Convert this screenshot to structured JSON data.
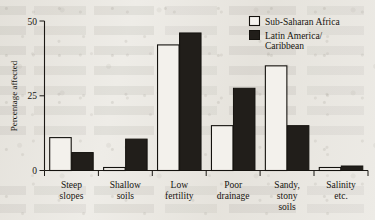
{
  "chart_data": {
    "type": "bar",
    "title": "",
    "xlabel": "",
    "ylabel": "Percentage affected",
    "ylim": [
      0,
      50
    ],
    "yticks": [
      0,
      25,
      50
    ],
    "ytick_labels": [
      "0",
      "25",
      "50"
    ],
    "grid": false,
    "legend_position": "top-right",
    "categories": [
      "Steep slopes",
      "Shallow soils",
      "Low fertility",
      "Poor drainage",
      "Sandy, stony soils",
      "Salinity etc."
    ],
    "category_lines": [
      [
        "Steep",
        "slopes"
      ],
      [
        "Shallow",
        "soils"
      ],
      [
        "Low",
        "fertility"
      ],
      [
        "Poor",
        "drainage"
      ],
      [
        "Sandy,",
        "stony",
        "soils"
      ],
      [
        "Salinity",
        "etc."
      ]
    ],
    "series": [
      {
        "name": "Sub-Saharan Africa",
        "style": "open",
        "color": "#f3f1ec",
        "values": [
          11,
          1,
          42,
          15,
          35,
          1
        ]
      },
      {
        "name": "Latin America/ Caribbean",
        "style": "solid",
        "color": "#211e1a",
        "values": [
          6,
          10.5,
          46,
          27.5,
          15,
          1.5
        ]
      }
    ]
  },
  "legend": {
    "items": [
      {
        "label": "Sub-Saharan Africa",
        "swatch": "open-square-icon"
      },
      {
        "label_line1": "Latin America/",
        "label_line2": "Caribbean",
        "swatch": "filled-square-icon"
      }
    ]
  },
  "axis": {
    "y_title": "Percentage affected",
    "y_tick_0": "0",
    "y_tick_25": "25",
    "y_tick_50": "50"
  },
  "colors": {
    "ink": "#16140f",
    "solid_bar": "#211e1a",
    "open_bar": "#f3f1ec",
    "paper": "#eceae5"
  }
}
